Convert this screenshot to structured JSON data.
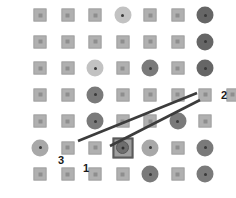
{
  "figure": {
    "width": 236,
    "height": 198,
    "background": "#ffffff"
  },
  "palette": {
    "square_fill": "#b0b0b0",
    "square_border": "#a2a2a2",
    "square_dot": "#8e8e8e",
    "circle_light": "#c2c2c2",
    "circle_medium": "#a8a8a8",
    "circle_dark": "#7a7a7a",
    "circle_darkest": "#666666",
    "circle_dot": "#3a3a3a",
    "line_color": "#3c3c3c",
    "selection_border": "#5a5a5a",
    "label_color": "#1a1a1a"
  },
  "lattice": {
    "origin_x": 40,
    "origin_y": 15,
    "step_x": 27.5,
    "step_y": 26.5,
    "rows": 7,
    "cols": 7,
    "nodes": [
      {
        "row": 1,
        "col": 1,
        "type": "square",
        "size": 13
      },
      {
        "row": 1,
        "col": 2,
        "type": "square",
        "size": 13
      },
      {
        "row": 1,
        "col": 3,
        "type": "square",
        "size": 13
      },
      {
        "row": 1,
        "col": 4,
        "type": "circle",
        "shade": "light",
        "size": 17
      },
      {
        "row": 1,
        "col": 5,
        "type": "square",
        "size": 13
      },
      {
        "row": 1,
        "col": 6,
        "type": "square",
        "size": 13
      },
      {
        "row": 1,
        "col": 7,
        "type": "circle",
        "shade": "darkest",
        "size": 17
      },
      {
        "row": 2,
        "col": 1,
        "type": "square",
        "size": 13
      },
      {
        "row": 2,
        "col": 2,
        "type": "square",
        "size": 13
      },
      {
        "row": 2,
        "col": 3,
        "type": "square",
        "size": 13
      },
      {
        "row": 2,
        "col": 4,
        "type": "square",
        "size": 13
      },
      {
        "row": 2,
        "col": 5,
        "type": "square",
        "size": 13
      },
      {
        "row": 2,
        "col": 6,
        "type": "square",
        "size": 13
      },
      {
        "row": 2,
        "col": 7,
        "type": "circle",
        "shade": "darkest",
        "size": 17
      },
      {
        "row": 3,
        "col": 1,
        "type": "square",
        "size": 13
      },
      {
        "row": 3,
        "col": 2,
        "type": "square",
        "size": 13
      },
      {
        "row": 3,
        "col": 3,
        "type": "circle",
        "shade": "light",
        "size": 17
      },
      {
        "row": 3,
        "col": 4,
        "type": "square",
        "size": 13
      },
      {
        "row": 3,
        "col": 5,
        "type": "circle",
        "shade": "dark",
        "size": 17
      },
      {
        "row": 3,
        "col": 6,
        "type": "square",
        "size": 13
      },
      {
        "row": 3,
        "col": 7,
        "type": "circle",
        "shade": "darkest",
        "size": 17
      },
      {
        "row": 4,
        "col": 1,
        "type": "square",
        "size": 13
      },
      {
        "row": 4,
        "col": 2,
        "type": "square",
        "size": 13
      },
      {
        "row": 4,
        "col": 3,
        "type": "circle",
        "shade": "dark",
        "size": 17
      },
      {
        "row": 4,
        "col": 4,
        "type": "square",
        "size": 13
      },
      {
        "row": 4,
        "col": 5,
        "type": "square",
        "size": 13
      },
      {
        "row": 4,
        "col": 6,
        "type": "square",
        "size": 13
      },
      {
        "row": 4,
        "col": 7,
        "type": "square",
        "size": 13
      },
      {
        "row": 4,
        "col": 8,
        "type": "square",
        "size": 13
      },
      {
        "row": 5,
        "col": 1,
        "type": "square",
        "size": 13
      },
      {
        "row": 5,
        "col": 2,
        "type": "square",
        "size": 13
      },
      {
        "row": 5,
        "col": 3,
        "type": "circle",
        "shade": "dark",
        "size": 17
      },
      {
        "row": 5,
        "col": 4,
        "type": "square",
        "size": 13
      },
      {
        "row": 5,
        "col": 5,
        "type": "square",
        "size": 13
      },
      {
        "row": 5,
        "col": 6,
        "type": "circle",
        "shade": "dark",
        "size": 17
      },
      {
        "row": 5,
        "col": 7,
        "type": "square",
        "size": 13
      },
      {
        "row": 6,
        "col": 1,
        "type": "circle",
        "shade": "medium",
        "size": 17
      },
      {
        "row": 6,
        "col": 2,
        "type": "square",
        "size": 13
      },
      {
        "row": 6,
        "col": 3,
        "type": "square",
        "size": 13
      },
      {
        "row": 6,
        "col": 4,
        "type": "selected",
        "size": 21
      },
      {
        "row": 6,
        "col": 5,
        "type": "circle",
        "shade": "medium",
        "size": 17
      },
      {
        "row": 6,
        "col": 6,
        "type": "square",
        "size": 13
      },
      {
        "row": 6,
        "col": 7,
        "type": "circle",
        "shade": "dark",
        "size": 17
      },
      {
        "row": 7,
        "col": 1,
        "type": "square",
        "size": 13
      },
      {
        "row": 7,
        "col": 2,
        "type": "square",
        "size": 13
      },
      {
        "row": 7,
        "col": 3,
        "type": "square",
        "size": 13
      },
      {
        "row": 7,
        "col": 4,
        "type": "square",
        "size": 13
      },
      {
        "row": 7,
        "col": 5,
        "type": "circle",
        "shade": "dark",
        "size": 17
      },
      {
        "row": 7,
        "col": 6,
        "type": "square",
        "size": 13
      },
      {
        "row": 7,
        "col": 7,
        "type": "circle",
        "shade": "dark",
        "size": 17
      }
    ]
  },
  "direction_lines": [
    {
      "name": "upper-line",
      "x1": 78,
      "y1": 141,
      "x2": 197,
      "y2": 93,
      "width": 2.6
    },
    {
      "name": "lower-line",
      "x1": 110,
      "y1": 146,
      "x2": 200,
      "y2": 100,
      "width": 2.6
    }
  ],
  "annotations": [
    {
      "id": "label-1",
      "text": "1",
      "x": 86,
      "y": 168
    },
    {
      "id": "label-2",
      "text": "2",
      "x": 224,
      "y": 95
    },
    {
      "id": "label-3",
      "text": "3",
      "x": 61,
      "y": 160
    }
  ]
}
